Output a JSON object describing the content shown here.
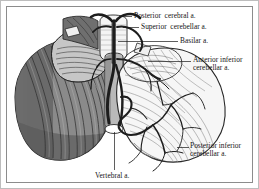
{
  "figure": {
    "view": "posterior",
    "frame_color": "#bdbdbd",
    "background_color": "#ffffff",
    "ink_color": "#151515"
  },
  "labels": [
    {
      "id": "posterior-cerebral",
      "text": "Posterior  cerebral a.",
      "x": 133,
      "y": 12,
      "leader": {
        "x1": 120,
        "y1": 16,
        "x2": 131,
        "y2": 16
      }
    },
    {
      "id": "superior-cerebellar",
      "text": "Superior  cerebellar a.",
      "x": 140,
      "y": 23,
      "leader": {
        "x1": 122,
        "y1": 27,
        "x2": 138,
        "y2": 27
      }
    },
    {
      "id": "basilar",
      "text": "Basilar a.",
      "x": 179,
      "y": 37,
      "leader": {
        "x1": 116,
        "y1": 41,
        "x2": 177,
        "y2": 41
      }
    },
    {
      "id": "anterior-inferior-cerebellar",
      "text": "Anterior inferior\ncerebellar a.",
      "x": 192,
      "y": 57,
      "leader": {
        "x1": 146,
        "y1": 61,
        "x2": 190,
        "y2": 61
      }
    },
    {
      "id": "posterior-inferior-cerebellar",
      "text": "Posterior inferior\ncerebellar a.",
      "x": 190,
      "y": 143,
      "leader": {
        "x1": 176,
        "y1": 147,
        "x2": 188,
        "y2": 147
      }
    },
    {
      "id": "vertebral",
      "text": "Vertebral a.",
      "x": 96,
      "y": 172,
      "leader": {
        "x1": 113,
        "y1": 130,
        "x2": 113,
        "y2": 169
      }
    }
  ],
  "anatomy": {
    "left_hemisphere": {
      "name": "left cerebellar hemisphere",
      "fill": "#8a8a8a",
      "shadow": "#5d5d5d",
      "folia_color": "#3a3a3a"
    },
    "right_hemisphere": {
      "name": "right cerebellar hemisphere",
      "fill": "#f2f2f2",
      "folia_color": "#707070"
    },
    "brainstem": {
      "name": "brainstem / medulla",
      "fill": "#d8d8d8",
      "outline": "#3a3a3a"
    },
    "arteries": {
      "name": "vertebrobasilar arterial tree",
      "color": "#232323"
    }
  }
}
